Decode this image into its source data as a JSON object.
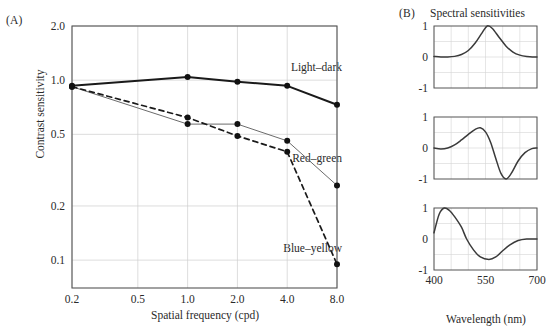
{
  "figure": {
    "panelA_label": "(A)",
    "panelB_label": "(B)",
    "panelB_title": "Spectral sensitivities"
  },
  "chart_data": [
    {
      "id": "contrast-sensitivity",
      "type": "line",
      "title": "",
      "xlabel": "Spatial frequency (cpd)",
      "ylabel": "Contrast sensitivity",
      "xscale": "log",
      "yscale": "log",
      "xlim": [
        0.2,
        8.0
      ],
      "ylim": [
        0.07,
        2.0
      ],
      "xticks": [
        0.2,
        0.5,
        1.0,
        2.0,
        4.0,
        8.0
      ],
      "xticklabels": [
        "0.2",
        "0.5",
        "1.0",
        "2.0",
        "4.0",
        "8.0"
      ],
      "yticks": [
        2.0,
        1.0,
        0.5,
        0.2,
        0.1
      ],
      "yticklabels": [
        "2.0",
        "1.0",
        "0.5",
        "0.2",
        "0.1"
      ],
      "grid": true,
      "legend": "none",
      "x": [
        0.2,
        1.0,
        2.0,
        4.0,
        8.0
      ],
      "series": [
        {
          "name": "Light-dark",
          "style": "solid-thick",
          "color": "#1a1a1a",
          "values": [
            0.93,
            1.04,
            0.98,
            0.93,
            0.73
          ]
        },
        {
          "name": "Red-green",
          "style": "solid-thin",
          "color": "#6b6b6b",
          "values": [
            0.92,
            0.57,
            0.57,
            0.46,
            0.26
          ]
        },
        {
          "name": "Blue-yellow",
          "style": "dashed",
          "color": "#1a1a1a",
          "values": [
            0.92,
            0.62,
            0.49,
            0.4,
            0.095
          ]
        }
      ]
    },
    {
      "id": "spectral-light-dark",
      "type": "line",
      "title": "",
      "row_label": "Light–dark",
      "xlabel": "",
      "ylabel": "",
      "xlim": [
        400,
        700
      ],
      "ylim": [
        -1,
        1
      ],
      "xticks": [
        400,
        550,
        700
      ],
      "xticklabels": [
        "",
        "",
        ""
      ],
      "yticks": [
        1,
        0,
        -1
      ],
      "yticklabels": [
        "1",
        "0",
        "-1"
      ],
      "grid": true,
      "x": [
        400,
        420,
        440,
        460,
        480,
        500,
        520,
        540,
        555,
        570,
        590,
        610,
        630,
        650,
        670,
        700
      ],
      "values": [
        0.02,
        0.0,
        0.0,
        0.02,
        0.08,
        0.21,
        0.45,
        0.78,
        1.0,
        0.92,
        0.63,
        0.35,
        0.16,
        0.06,
        0.02,
        0.0
      ]
    },
    {
      "id": "spectral-red-green",
      "type": "line",
      "title": "",
      "row_label": "Red–green",
      "xlabel": "",
      "ylabel": "",
      "xlim": [
        400,
        700
      ],
      "ylim": [
        -1,
        1
      ],
      "xticks": [
        400,
        550,
        700
      ],
      "xticklabels": [
        "",
        "",
        ""
      ],
      "yticks": [
        1,
        0,
        -1
      ],
      "yticklabels": [
        "1",
        "0",
        "-1"
      ],
      "grid": true,
      "x": [
        400,
        420,
        440,
        460,
        480,
        500,
        520,
        535,
        550,
        565,
        580,
        595,
        610,
        625,
        645,
        665,
        685,
        700
      ],
      "values": [
        0.0,
        -0.03,
        0.0,
        0.1,
        0.26,
        0.44,
        0.6,
        0.65,
        0.52,
        0.18,
        -0.34,
        -0.82,
        -1.0,
        -0.82,
        -0.42,
        -0.15,
        -0.02,
        0.0
      ]
    },
    {
      "id": "spectral-blue-yellow",
      "type": "line",
      "title": "",
      "row_label": "Blue–yellow",
      "xlabel": "Wavelength (nm)",
      "ylabel": "",
      "xlim": [
        400,
        700
      ],
      "ylim": [
        -1,
        1
      ],
      "xticks": [
        400,
        550,
        700
      ],
      "xticklabels": [
        "400",
        "550",
        "700"
      ],
      "yticks": [
        1,
        0,
        -1
      ],
      "yticklabels": [
        "1",
        "0",
        "-1"
      ],
      "grid": true,
      "x": [
        400,
        415,
        430,
        445,
        460,
        480,
        495,
        515,
        535,
        560,
        580,
        600,
        620,
        645,
        670,
        700
      ],
      "values": [
        0.2,
        0.8,
        1.0,
        0.92,
        0.72,
        0.38,
        0.0,
        -0.35,
        -0.58,
        -0.66,
        -0.58,
        -0.38,
        -0.2,
        -0.05,
        0.0,
        0.0
      ]
    }
  ]
}
